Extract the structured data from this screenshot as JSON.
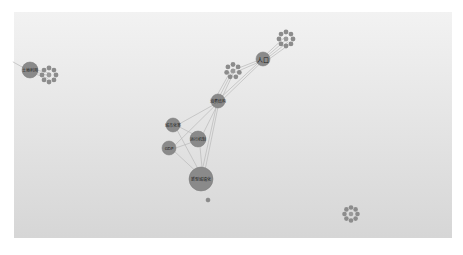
{
  "graph": {
    "background": {
      "top": "#f2f2f2",
      "bottom": "#d6d6d6"
    },
    "node_color": "#8a8a8a",
    "edge_color": "#b9b9b9",
    "nodes": [
      {
        "id": "n_land",
        "label": "土地利用",
        "x": 30,
        "y": 70,
        "r": 8,
        "font": 4
      },
      {
        "id": "n_pop",
        "label": "人口",
        "x": 263,
        "y": 59,
        "r": 7,
        "font": 6
      },
      {
        "id": "n_consume",
        "label": "消费结构",
        "x": 218,
        "y": 101,
        "r": 7,
        "font": 4
      },
      {
        "id": "n_urban_rate",
        "label": "城市化率",
        "x": 173,
        "y": 125,
        "r": 7,
        "font": 4
      },
      {
        "id": "n_mechanism",
        "label": "运行机制",
        "x": 198,
        "y": 139,
        "r": 8,
        "font": 4
      },
      {
        "id": "n_gdp",
        "label": "GDP",
        "x": 169,
        "y": 148,
        "r": 7,
        "font": 4
      },
      {
        "id": "n_newurban",
        "label": "新型城镇化",
        "x": 201,
        "y": 179,
        "r": 12,
        "font": 4
      },
      {
        "id": "n_dot",
        "label": "",
        "x": 208,
        "y": 200,
        "r": 2,
        "font": 0
      }
    ],
    "clusters": [
      {
        "id": "c_left",
        "x": 49,
        "y": 75,
        "ring_r": 7,
        "petal_r": 2.4,
        "petals": 8
      },
      {
        "id": "c_pop",
        "x": 286,
        "y": 39,
        "ring_r": 7,
        "petal_r": 2.4,
        "petals": 8
      },
      {
        "id": "c_mid",
        "x": 233,
        "y": 71,
        "ring_r": 6.5,
        "petal_r": 2.4,
        "petals": 7
      },
      {
        "id": "c_isolated",
        "x": 351,
        "y": 214,
        "ring_r": 6.5,
        "petal_r": 2.3,
        "petals": 8
      }
    ],
    "edges": [
      [
        "n_land",
        "c_left"
      ],
      [
        "n_land",
        "c_left"
      ],
      [
        "n_land",
        "c_left"
      ],
      [
        "n_land",
        "edge_left"
      ],
      [
        "n_pop",
        "c_pop"
      ],
      [
        "n_pop",
        "c_pop"
      ],
      [
        "n_pop",
        "c_pop"
      ],
      [
        "n_pop",
        "c_pop"
      ],
      [
        "n_pop",
        "c_mid"
      ],
      [
        "n_pop",
        "c_mid"
      ],
      [
        "n_pop",
        "n_consume"
      ],
      [
        "n_pop",
        "n_consume"
      ],
      [
        "c_mid",
        "n_consume"
      ],
      [
        "c_mid",
        "n_consume"
      ],
      [
        "c_mid",
        "n_consume"
      ],
      [
        "n_consume",
        "n_urban_rate"
      ],
      [
        "n_consume",
        "n_mechanism"
      ],
      [
        "n_consume",
        "n_gdp"
      ],
      [
        "n_consume",
        "n_newurban"
      ],
      [
        "n_consume",
        "n_newurban"
      ],
      [
        "n_urban_rate",
        "n_mechanism"
      ],
      [
        "n_urban_rate",
        "n_newurban"
      ],
      [
        "n_mechanism",
        "n_newurban"
      ],
      [
        "n_mechanism",
        "n_gdp"
      ],
      [
        "n_gdp",
        "n_newurban"
      ]
    ]
  }
}
